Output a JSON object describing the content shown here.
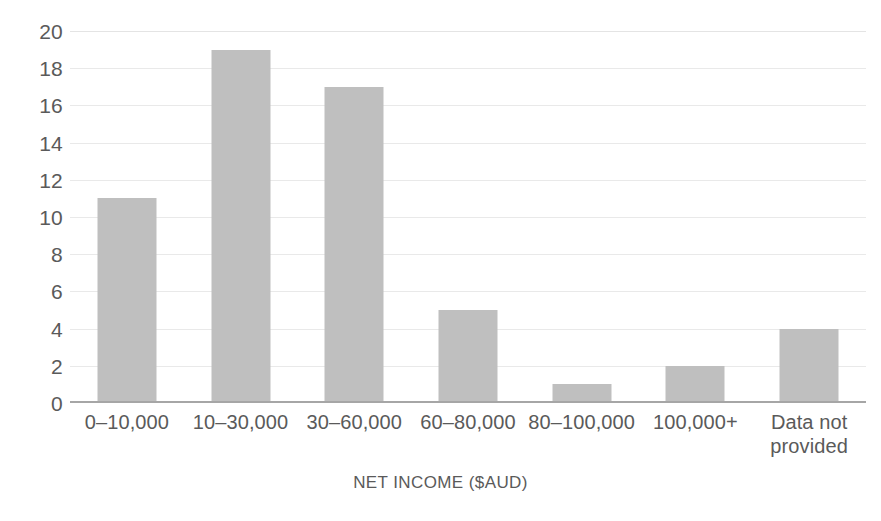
{
  "chart_data": {
    "type": "bar",
    "title": "",
    "subtitle": "",
    "xlabel": "NET INCOME ($AUD)",
    "ylabel": "",
    "categories": [
      "0–10,000",
      "10–30,000",
      "30–60,000",
      "60–80,000",
      "80–100,000",
      "100,000+",
      "Data not provided"
    ],
    "values": [
      11,
      19,
      17,
      5,
      1,
      2,
      4
    ],
    "ylim": [
      0,
      20
    ],
    "y_ticks": [
      0,
      2,
      4,
      6,
      8,
      10,
      12,
      14,
      16,
      18,
      20
    ],
    "y_tick_labels": [
      "0",
      "2",
      "4",
      "6",
      "8",
      "10",
      "12",
      "14",
      "16",
      "18",
      "20"
    ],
    "grid": true,
    "grid_axis": "y",
    "legend": false,
    "legend_position": "none",
    "orientation": "vertical",
    "bar_color": "#bfbfbf",
    "text_color": "#5a5a5a",
    "gridline_color": "#e9e9e9",
    "axis_color": "#a6a6a6",
    "background_color": "#ffffff"
  }
}
